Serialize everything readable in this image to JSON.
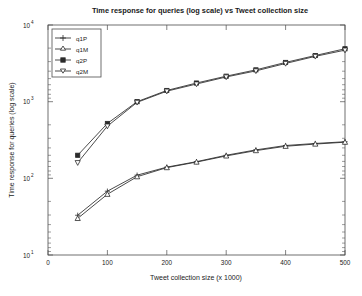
{
  "chart_data": {
    "type": "line",
    "title": "Time response for queries (log scale) vs Tweet collection size",
    "xlabel": "Tweet collection size (x 1000)",
    "ylabel": "Time response for queries (log scale)",
    "yscale": "log",
    "xlim": [
      0,
      500
    ],
    "ylim": [
      10,
      10000
    ],
    "grid": false,
    "legend_position": "top-left",
    "x_ticks": [
      "0",
      "100",
      "200",
      "300",
      "400",
      "500"
    ],
    "x_tick_values": [
      0,
      100,
      200,
      300,
      400,
      500
    ],
    "y_ticks": [
      "10^1",
      "10^2",
      "10^3",
      "10^4"
    ],
    "y_tick_values": [
      10,
      100,
      1000,
      10000
    ],
    "x": [
      50,
      100,
      150,
      200,
      250,
      300,
      350,
      400,
      450,
      500
    ],
    "series": [
      {
        "name": "q1P",
        "marker": "plus",
        "values": [
          33,
          68,
          110,
          140,
          165,
          200,
          235,
          268,
          285,
          300
        ]
      },
      {
        "name": "q1M",
        "marker": "triangle-up",
        "values": [
          30,
          62,
          105,
          138,
          163,
          196,
          230,
          262,
          280,
          296
        ]
      },
      {
        "name": "q2P",
        "marker": "square",
        "values": [
          200,
          520,
          1000,
          1400,
          1750,
          2150,
          2600,
          3250,
          4000,
          4900
        ]
      },
      {
        "name": "q2M",
        "marker": "triangle-down",
        "values": [
          160,
          480,
          980,
          1370,
          1700,
          2100,
          2520,
          3150,
          3900,
          4700
        ]
      }
    ]
  },
  "legend": {
    "entries": [
      {
        "label": "q1P"
      },
      {
        "label": "q1M"
      },
      {
        "label": "q2P"
      },
      {
        "label": "q2M"
      }
    ]
  },
  "axis_text": {
    "y_exp_4": "4",
    "y_exp_3": "3",
    "y_exp_2": "2",
    "y_exp_1": "1",
    "y_base": "10"
  }
}
